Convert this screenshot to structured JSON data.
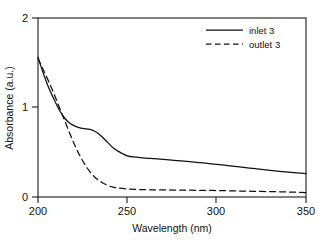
{
  "chart_data": {
    "type": "line",
    "title": "",
    "xlabel": "Wavelength (nm)",
    "ylabel": "Absorbance (a.u.)",
    "xlim": [
      200,
      350
    ],
    "ylim": [
      0,
      2
    ],
    "xticks": [
      200,
      250,
      300,
      350
    ],
    "yticks": [
      0,
      1,
      2
    ],
    "xtick_labels": [
      "200",
      "250",
      "300",
      "350"
    ],
    "ytick_labels": [
      "0",
      "1",
      "2"
    ],
    "grid": false,
    "legend_position": "top-right",
    "frame": "box",
    "series": [
      {
        "name": "inlet 3",
        "style": "solid",
        "color": "#111111",
        "x": [
          200,
          203,
          206,
          209,
          212,
          215,
          218,
          221,
          224,
          227,
          230,
          233,
          236,
          239,
          242,
          245,
          250,
          255,
          260,
          265,
          270,
          275,
          280,
          285,
          290,
          295,
          300,
          305,
          310,
          315,
          320,
          325,
          330,
          335,
          340,
          345,
          350
        ],
        "y": [
          1.56,
          1.38,
          1.22,
          1.09,
          0.97,
          0.88,
          0.82,
          0.79,
          0.77,
          0.76,
          0.75,
          0.72,
          0.67,
          0.61,
          0.55,
          0.51,
          0.46,
          0.445,
          0.435,
          0.428,
          0.42,
          0.412,
          0.403,
          0.394,
          0.385,
          0.375,
          0.365,
          0.354,
          0.343,
          0.332,
          0.32,
          0.308,
          0.297,
          0.287,
          0.278,
          0.27,
          0.262
        ]
      },
      {
        "name": "outlet 3",
        "style": "dashed",
        "color": "#111111",
        "x": [
          200,
          203,
          206,
          209,
          212,
          215,
          218,
          221,
          224,
          227,
          230,
          233,
          236,
          239,
          242,
          245,
          250,
          255,
          260,
          265,
          270,
          275,
          280,
          285,
          290,
          295,
          300,
          305,
          310,
          315,
          320,
          325,
          330,
          335,
          340,
          345,
          350
        ],
        "y": [
          1.55,
          1.42,
          1.29,
          1.15,
          1.0,
          0.85,
          0.7,
          0.56,
          0.44,
          0.34,
          0.26,
          0.2,
          0.16,
          0.13,
          0.11,
          0.1,
          0.09,
          0.085,
          0.082,
          0.08,
          0.079,
          0.078,
          0.077,
          0.076,
          0.075,
          0.074,
          0.072,
          0.07,
          0.068,
          0.066,
          0.064,
          0.062,
          0.06,
          0.058,
          0.056,
          0.054,
          0.05
        ]
      }
    ],
    "legend": [
      {
        "label": "inlet 3",
        "style": "solid"
      },
      {
        "label": "outlet 3",
        "style": "dashed"
      }
    ]
  }
}
